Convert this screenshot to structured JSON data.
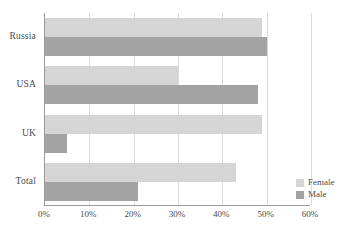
{
  "chart_data": {
    "type": "bar",
    "orientation": "horizontal",
    "title": "",
    "subtitle": "",
    "xlabel": "",
    "ylabel": "",
    "categories": [
      "Russia",
      "USA",
      "UK",
      "Total"
    ],
    "series": [
      {
        "name": "Female",
        "color": "#d5d5d5",
        "values": [
          49,
          30,
          49,
          43
        ]
      },
      {
        "name": "Male",
        "color": "#a3a3a3",
        "values": [
          50,
          48,
          5,
          21
        ]
      }
    ],
    "xlim": [
      0,
      60
    ],
    "xticks": [
      0,
      10,
      20,
      30,
      40,
      50,
      60
    ],
    "xtick_labels": [
      "0%",
      "10%",
      "20%",
      "30%",
      "40%",
      "50%",
      "60%"
    ],
    "grid": true,
    "grid_axis": "x",
    "legend": {
      "position": "bottom-right-inside",
      "entries": [
        {
          "label": "Female",
          "color": "#d5d5d5"
        },
        {
          "label": "Male",
          "color": "#a3a3a3"
        }
      ]
    },
    "axis_color": "#9a9a9a",
    "grid_color": "#dcdcdc",
    "background": "#ffffff"
  }
}
